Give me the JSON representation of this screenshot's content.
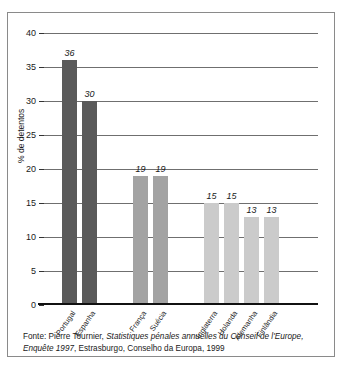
{
  "figure": {
    "ylabel": "% de detentos",
    "source_prefix": "Fonte: Pierre Tournier, ",
    "source_italic": "Statistiques pénales annuelles du Conseil de l'Europe, Enquête 1997",
    "source_suffix": ", Estrasburgo, Conselho da Europa, 1999"
  },
  "colors": {
    "group_dark": "#5a5a5a",
    "group_medium": "#a3a3a3",
    "group_light": "#cbcbcb",
    "gridline": "#6f6f6f",
    "border": "#8a8a8a",
    "text": "#1a1a1a"
  },
  "chart_data": {
    "type": "bar",
    "title": "",
    "xlabel": "",
    "ylabel": "% de detentos",
    "ylim": [
      0,
      40
    ],
    "yticks": [
      0,
      5,
      10,
      15,
      20,
      25,
      30,
      35,
      40
    ],
    "grid": true,
    "legend": "none",
    "categories": [
      "Portugal",
      "Espanha",
      "França",
      "Suécia",
      "Inglaterra",
      "Holanda",
      "Alemanha",
      "Finlândia"
    ],
    "values": [
      36,
      30,
      19,
      19,
      15,
      15,
      13,
      13
    ],
    "value_labels": [
      "36",
      "30",
      "19",
      "19",
      "15",
      "15",
      "13",
      "13"
    ],
    "bar_colors": [
      "#5a5a5a",
      "#5a5a5a",
      "#a3a3a3",
      "#a3a3a3",
      "#cbcbcb",
      "#cbcbcb",
      "#cbcbcb",
      "#cbcbcb"
    ],
    "source": "Fonte: Pierre Tournier, Statistiques pénales annuelles du Conseil de l'Europe, Enquête 1997, Estrasburgo, Conselho da Europa, 1999"
  }
}
